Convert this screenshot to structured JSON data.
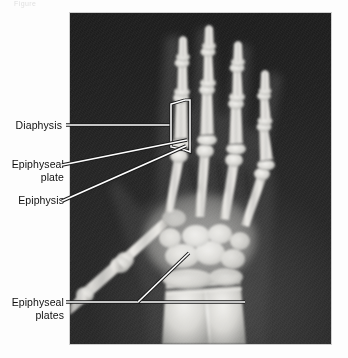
{
  "figure": {
    "caption_fragment": "Figure",
    "modality": "radiograph",
    "plate": {
      "x": 70,
      "y": 13,
      "width": 261,
      "height": 331,
      "background_color": "#1f1f1f",
      "bone_color": "#e8e8e6",
      "border_color": "#cfcfcf"
    }
  },
  "annotations": [
    {
      "id": "diaphysis",
      "label": "Diaphysis",
      "label_x": 12,
      "label_y": 119,
      "marker_type": "bracket-outline",
      "leader": "horizontal",
      "target": "shaft of proximal phalanx, index finger"
    },
    {
      "id": "epiphyseal-plate",
      "label": "Epiphyseal\nplate",
      "label_x": 10,
      "label_y": 158,
      "marker_type": "double-line",
      "leader": "diagonal",
      "target": "growth plate at head of metacarpal / base of proximal phalanx"
    },
    {
      "id": "epiphysis",
      "label": "Epiphysis",
      "label_x": 12,
      "label_y": 194,
      "marker_type": "double-line",
      "leader": "diagonal",
      "target": "base of proximal phalanx, index finger"
    },
    {
      "id": "epiphyseal-plates",
      "label": "Epiphyseal\nplates",
      "label_x": 10,
      "label_y": 296,
      "marker_type": "double-line",
      "leader": "branching",
      "target": "distal radius and distal ulna growth plates"
    }
  ],
  "colors": {
    "page_background": "#ffffff",
    "label_text": "#101010",
    "leader_line": "#ffffff",
    "leader_outline": "#1a1a1a"
  }
}
